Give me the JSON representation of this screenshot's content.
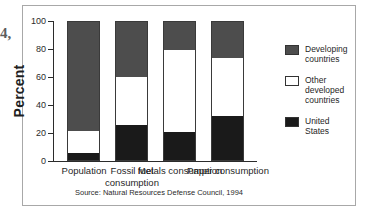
{
  "margin_bleed_text": "4,",
  "source_note": "Source: Natural Resources Defense Council, 1994",
  "axis": {
    "y_title": "Percent",
    "y_ticks": [
      "0",
      "20",
      "40",
      "60",
      "80",
      "100"
    ]
  },
  "legend": {
    "items": [
      {
        "label": "Developing\ncountries",
        "color": "#4d4d4d",
        "key": "developing"
      },
      {
        "label": "Other\ndeveloped\ncountries",
        "color": "#ffffff",
        "key": "other_developed"
      },
      {
        "label": "United\nStates",
        "color": "#1a1a1a",
        "key": "united_states"
      }
    ]
  },
  "categories_display": [
    "Population",
    "Fossil fuel\nconsumption",
    "Metals\nconsumption",
    "Paper\nconsumption"
  ],
  "chart_data": {
    "type": "bar",
    "subtype": "stacked-bar-100-percent",
    "title": "",
    "xlabel": "",
    "ylabel": "Percent",
    "ylim": [
      0,
      100
    ],
    "yticks": [
      0,
      20,
      40,
      60,
      80,
      100
    ],
    "grid": false,
    "legend_position": "right",
    "categories": [
      "Population",
      "Fossil fuel consumption",
      "Metals consumption",
      "Paper consumption"
    ],
    "series": [
      {
        "name": "United States",
        "color": "#1a1a1a",
        "values": [
          5,
          25,
          20,
          32
        ]
      },
      {
        "name": "Other developed countries",
        "color": "#ffffff",
        "values": [
          16,
          35,
          60,
          42
        ]
      },
      {
        "name": "Developing countries",
        "color": "#4d4d4d",
        "values": [
          79,
          40,
          20,
          26
        ]
      }
    ],
    "stack_order_bottom_to_top": [
      "United States",
      "Other developed countries",
      "Developing countries"
    ],
    "cumulative_tops": {
      "United States": [
        5,
        25,
        20,
        32
      ],
      "Other developed countries": [
        21,
        60,
        80,
        74
      ],
      "Developing countries": [
        100,
        100,
        100,
        100
      ]
    },
    "annotations": [
      "Source: Natural Resources Defense Council, 1994"
    ]
  }
}
